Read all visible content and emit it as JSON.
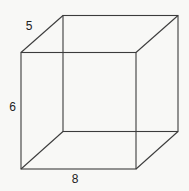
{
  "diagram": {
    "type": "rectangular-prism-wireframe",
    "labels": {
      "depth": "5",
      "height": "6",
      "width": "8"
    },
    "colors": {
      "background": "#f8f8f6",
      "line": "#3c3c3c",
      "text": "#222222"
    }
  }
}
